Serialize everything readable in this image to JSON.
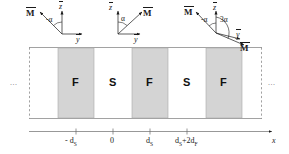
{
  "figure": {
    "colors": {
      "ferromagnet_fill": "#d4d4d4",
      "superconductor_fill": "#ffffff",
      "stroke": "#8a8a8a",
      "text": "#1a1a1a",
      "dots": "#777777"
    }
  },
  "coordinate_systems": [
    {
      "id": "left",
      "m_label": "M",
      "z_label": "z",
      "y_label": "y",
      "angle_label": "-α",
      "m_direction": "up-left"
    },
    {
      "id": "middle",
      "m_label": "M",
      "z_label": "z",
      "y_label": "y",
      "angle_label": "α",
      "m_direction": "up-right"
    },
    {
      "id": "right",
      "m_label": "M",
      "m_label_2": "M",
      "z_label": "z",
      "y_label": "y",
      "angle_label": "-α",
      "angle_label_2": "3α",
      "m_direction": "up-left",
      "m_direction_2": "down-right"
    }
  ],
  "stack": {
    "left_ellipsis": "...",
    "right_ellipsis": "...",
    "layers": [
      {
        "label": "",
        "type": "edge"
      },
      {
        "label": "F",
        "type": "ferromagnet"
      },
      {
        "label": "S",
        "type": "superconductor"
      },
      {
        "label": "F",
        "type": "ferromagnet"
      },
      {
        "label": "S",
        "type": "superconductor"
      },
      {
        "label": "F",
        "type": "ferromagnet"
      },
      {
        "label": "",
        "type": "edge"
      }
    ]
  },
  "axis": {
    "name": "x",
    "ticks": [
      {
        "label": "- d",
        "sub": "S"
      },
      {
        "label": "0",
        "sub": ""
      },
      {
        "label": "d",
        "sub": "S"
      },
      {
        "label": "d",
        "sub": "S",
        "suffix": "+2d",
        "suffix_sub": "F"
      }
    ]
  }
}
